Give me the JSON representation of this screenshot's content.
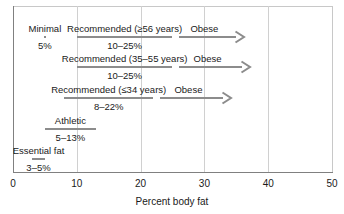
{
  "chart_data": {
    "type": "bar",
    "title": "",
    "subtitle": "",
    "xlabel": "Percent body fat",
    "ylabel": "",
    "xlim": [
      0,
      50
    ],
    "xticks": [
      0,
      10,
      20,
      30,
      40,
      50
    ],
    "xticklabels": [
      "0",
      "10",
      "20",
      "30",
      "40",
      "50"
    ],
    "grid": "vertical",
    "legend": "none",
    "orientation": "horizontal",
    "categories": [
      "Recommended (≥56 years)",
      "Recommended (35–55 years)",
      "Recommended (≤34 years)",
      "Athletic",
      "Essential fat"
    ],
    "rows": [
      {
        "row_index": 0,
        "y_px": 30,
        "bars": [
          {
            "label": "Minimal",
            "range_text": "5%",
            "start": 5,
            "end": 5,
            "label_center": 5,
            "style": "point"
          },
          {
            "label": "Recommended (≥56 years)",
            "range_text": "10–25%",
            "start": 10,
            "end": 25,
            "label_center": 17.5,
            "style": "bar"
          },
          {
            "label": "Obese",
            "range_text": "",
            "start": 26,
            "end": 36,
            "label_center": 30,
            "style": "arrow"
          }
        ]
      },
      {
        "row_index": 1,
        "y_px": 60,
        "bars": [
          {
            "label": "Recommended (35–55 years)",
            "range_text": "10–25%",
            "start": 10,
            "end": 25,
            "label_center": 17.5,
            "style": "bar"
          },
          {
            "label": "Obese",
            "range_text": "",
            "start": 26,
            "end": 37,
            "label_center": 30.5,
            "style": "arrow"
          }
        ]
      },
      {
        "row_index": 2,
        "y_px": 91,
        "bars": [
          {
            "label": "Recommended (≤34 years)",
            "range_text": "8–22%",
            "start": 8,
            "end": 22,
            "label_center": 15,
            "style": "bar"
          },
          {
            "label": "Obese",
            "range_text": "",
            "start": 23,
            "end": 34,
            "label_center": 27.5,
            "style": "arrow"
          }
        ]
      },
      {
        "row_index": 3,
        "y_px": 122,
        "bars": [
          {
            "label": "Athletic",
            "range_text": "5–13%",
            "start": 5,
            "end": 13,
            "label_center": 9,
            "style": "bar"
          }
        ]
      },
      {
        "row_index": 4,
        "y_px": 152,
        "bars": [
          {
            "label": "Essential fat",
            "range_text": "3–5%",
            "start": 3,
            "end": 5,
            "label_center": 4,
            "style": "bar"
          }
        ]
      }
    ]
  },
  "axis": {
    "title": "Percent body fat",
    "ticks": [
      {
        "value": "0"
      },
      {
        "value": "10"
      },
      {
        "value": "20"
      },
      {
        "value": "30"
      },
      {
        "value": "40"
      },
      {
        "value": "50"
      }
    ]
  },
  "colors": {
    "bar": "#8c8c8c",
    "grid": "#d0d0d0",
    "axis": "#808080",
    "text": "#1a1a1a",
    "background": "#ffffff"
  }
}
